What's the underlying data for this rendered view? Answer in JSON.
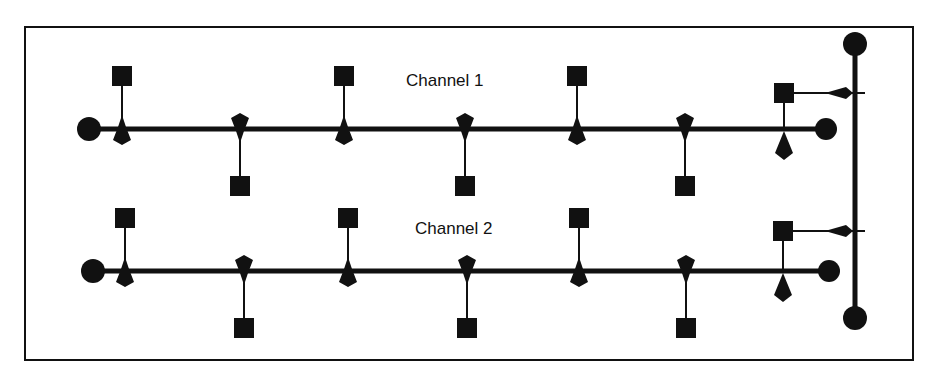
{
  "diagram": {
    "type": "dual-channel bus network",
    "frame": {
      "x": 25,
      "y": 27,
      "w": 888,
      "h": 333
    },
    "colors": {
      "ink": "#111111",
      "background": "#ffffff"
    },
    "channels": [
      {
        "label": "Channel 1",
        "label_pos": {
          "x": 406,
          "y": 86
        },
        "bus": {
          "y": 129,
          "x1": 89,
          "x2": 826
        },
        "taps": [
          {
            "x": 122,
            "dir": "up"
          },
          {
            "x": 240,
            "dir": "down"
          },
          {
            "x": 344,
            "dir": "up"
          },
          {
            "x": 465,
            "dir": "down"
          },
          {
            "x": 577,
            "dir": "up"
          },
          {
            "x": 685,
            "dir": "down"
          }
        ],
        "bridge": {
          "x": 784,
          "square_y": 93,
          "link_y": 93
        }
      },
      {
        "label": "Channel 2",
        "label_pos": {
          "x": 415,
          "y": 234
        },
        "bus": {
          "y": 271,
          "x1": 93,
          "x2": 829
        },
        "taps": [
          {
            "x": 125,
            "dir": "up"
          },
          {
            "x": 244,
            "dir": "down"
          },
          {
            "x": 348,
            "dir": "up"
          },
          {
            "x": 467,
            "dir": "down"
          },
          {
            "x": 579,
            "dir": "up"
          },
          {
            "x": 686,
            "dir": "down"
          }
        ],
        "bridge": {
          "x": 783,
          "square_y": 231,
          "link_y": 231
        }
      }
    ],
    "backbone": {
      "x": 855,
      "y1": 44,
      "y2": 318
    }
  }
}
